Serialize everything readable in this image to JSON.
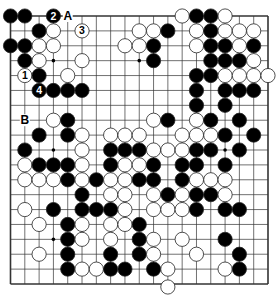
{
  "diagram": {
    "type": "go-board",
    "size": 19,
    "colors": {
      "black": "#000000",
      "white": "#ffffff",
      "line": "#333333"
    },
    "stars": [
      [
        3,
        3
      ],
      [
        3,
        9
      ],
      [
        9,
        3
      ],
      [
        9,
        9
      ],
      [
        9,
        15
      ],
      [
        15,
        3
      ]
    ],
    "stones": [
      {
        "r": 0,
        "c": 0,
        "color": "B"
      },
      {
        "r": 0,
        "c": 1,
        "color": "B"
      },
      {
        "r": 0,
        "c": 3,
        "color": "B",
        "label": "2"
      },
      {
        "r": 0,
        "c": 12,
        "color": "W"
      },
      {
        "r": 0,
        "c": 13,
        "color": "B"
      },
      {
        "r": 0,
        "c": 14,
        "color": "B"
      },
      {
        "r": 0,
        "c": 15,
        "color": "W"
      },
      {
        "r": 1,
        "c": 2,
        "color": "B"
      },
      {
        "r": 1,
        "c": 3,
        "color": "W"
      },
      {
        "r": 1,
        "c": 5,
        "color": "W",
        "label": "3"
      },
      {
        "r": 1,
        "c": 9,
        "color": "W"
      },
      {
        "r": 1,
        "c": 10,
        "color": "W"
      },
      {
        "r": 1,
        "c": 11,
        "color": "B"
      },
      {
        "r": 1,
        "c": 13,
        "color": "W"
      },
      {
        "r": 1,
        "c": 14,
        "color": "B"
      },
      {
        "r": 1,
        "c": 15,
        "color": "W"
      },
      {
        "r": 1,
        "c": 16,
        "color": "W"
      },
      {
        "r": 1,
        "c": 17,
        "color": "W"
      },
      {
        "r": 2,
        "c": 0,
        "color": "B"
      },
      {
        "r": 2,
        "c": 1,
        "color": "B"
      },
      {
        "r": 2,
        "c": 2,
        "color": "W"
      },
      {
        "r": 2,
        "c": 3,
        "color": "W"
      },
      {
        "r": 2,
        "c": 8,
        "color": "W"
      },
      {
        "r": 2,
        "c": 9,
        "color": "W"
      },
      {
        "r": 2,
        "c": 10,
        "color": "B"
      },
      {
        "r": 2,
        "c": 13,
        "color": "W"
      },
      {
        "r": 2,
        "c": 14,
        "color": "B"
      },
      {
        "r": 2,
        "c": 15,
        "color": "B"
      },
      {
        "r": 2,
        "c": 16,
        "color": "W"
      },
      {
        "r": 2,
        "c": 17,
        "color": "B"
      },
      {
        "r": 3,
        "c": 1,
        "color": "B"
      },
      {
        "r": 3,
        "c": 2,
        "color": "W"
      },
      {
        "r": 3,
        "c": 5,
        "color": "W"
      },
      {
        "r": 3,
        "c": 10,
        "color": "B"
      },
      {
        "r": 3,
        "c": 14,
        "color": "B"
      },
      {
        "r": 3,
        "c": 15,
        "color": "B"
      },
      {
        "r": 3,
        "c": 16,
        "color": "B"
      },
      {
        "r": 3,
        "c": 17,
        "color": "W"
      },
      {
        "r": 4,
        "c": 1,
        "color": "W",
        "label": "1"
      },
      {
        "r": 4,
        "c": 2,
        "color": "B"
      },
      {
        "r": 4,
        "c": 4,
        "color": "W"
      },
      {
        "r": 4,
        "c": 13,
        "color": "B"
      },
      {
        "r": 4,
        "c": 14,
        "color": "B"
      },
      {
        "r": 4,
        "c": 15,
        "color": "W"
      },
      {
        "r": 4,
        "c": 16,
        "color": "W"
      },
      {
        "r": 4,
        "c": 17,
        "color": "W"
      },
      {
        "r": 4,
        "c": 18,
        "color": "W"
      },
      {
        "r": 5,
        "c": 2,
        "color": "B",
        "label": "4"
      },
      {
        "r": 5,
        "c": 3,
        "color": "B"
      },
      {
        "r": 5,
        "c": 4,
        "color": "B"
      },
      {
        "r": 5,
        "c": 5,
        "color": "B"
      },
      {
        "r": 5,
        "c": 13,
        "color": "B"
      },
      {
        "r": 5,
        "c": 15,
        "color": "B"
      },
      {
        "r": 5,
        "c": 16,
        "color": "B"
      },
      {
        "r": 5,
        "c": 17,
        "color": "B"
      },
      {
        "r": 6,
        "c": 13,
        "color": "B"
      },
      {
        "r": 6,
        "c": 15,
        "color": "B"
      },
      {
        "r": 7,
        "c": 3,
        "color": "W"
      },
      {
        "r": 7,
        "c": 4,
        "color": "B"
      },
      {
        "r": 7,
        "c": 10,
        "color": "W"
      },
      {
        "r": 7,
        "c": 11,
        "color": "B"
      },
      {
        "r": 7,
        "c": 13,
        "color": "W"
      },
      {
        "r": 7,
        "c": 14,
        "color": "B"
      },
      {
        "r": 7,
        "c": 16,
        "color": "B"
      },
      {
        "r": 8,
        "c": 2,
        "color": "B"
      },
      {
        "r": 8,
        "c": 4,
        "color": "B"
      },
      {
        "r": 8,
        "c": 5,
        "color": "W"
      },
      {
        "r": 8,
        "c": 7,
        "color": "W"
      },
      {
        "r": 8,
        "c": 8,
        "color": "W"
      },
      {
        "r": 8,
        "c": 9,
        "color": "W"
      },
      {
        "r": 8,
        "c": 12,
        "color": "W"
      },
      {
        "r": 8,
        "c": 13,
        "color": "W"
      },
      {
        "r": 8,
        "c": 14,
        "color": "W"
      },
      {
        "r": 8,
        "c": 15,
        "color": "B"
      },
      {
        "r": 8,
        "c": 17,
        "color": "B"
      },
      {
        "r": 9,
        "c": 1,
        "color": "B"
      },
      {
        "r": 9,
        "c": 5,
        "color": "W"
      },
      {
        "r": 9,
        "c": 7,
        "color": "B"
      },
      {
        "r": 9,
        "c": 8,
        "color": "B"
      },
      {
        "r": 9,
        "c": 9,
        "color": "B"
      },
      {
        "r": 9,
        "c": 10,
        "color": "W"
      },
      {
        "r": 9,
        "c": 11,
        "color": "W"
      },
      {
        "r": 9,
        "c": 12,
        "color": "W"
      },
      {
        "r": 9,
        "c": 13,
        "color": "B"
      },
      {
        "r": 9,
        "c": 14,
        "color": "B"
      },
      {
        "r": 9,
        "c": 16,
        "color": "B"
      },
      {
        "r": 10,
        "c": 1,
        "color": "W"
      },
      {
        "r": 10,
        "c": 2,
        "color": "B"
      },
      {
        "r": 10,
        "c": 3,
        "color": "B"
      },
      {
        "r": 10,
        "c": 4,
        "color": "B"
      },
      {
        "r": 10,
        "c": 5,
        "color": "W"
      },
      {
        "r": 10,
        "c": 7,
        "color": "B"
      },
      {
        "r": 10,
        "c": 8,
        "color": "W"
      },
      {
        "r": 10,
        "c": 9,
        "color": "W"
      },
      {
        "r": 10,
        "c": 10,
        "color": "B"
      },
      {
        "r": 10,
        "c": 12,
        "color": "B"
      },
      {
        "r": 10,
        "c": 13,
        "color": "B"
      },
      {
        "r": 10,
        "c": 15,
        "color": "B"
      },
      {
        "r": 11,
        "c": 1,
        "color": "W"
      },
      {
        "r": 11,
        "c": 2,
        "color": "W"
      },
      {
        "r": 11,
        "c": 3,
        "color": "W"
      },
      {
        "r": 11,
        "c": 4,
        "color": "B"
      },
      {
        "r": 11,
        "c": 5,
        "color": "W"
      },
      {
        "r": 11,
        "c": 6,
        "color": "B"
      },
      {
        "r": 11,
        "c": 7,
        "color": "W"
      },
      {
        "r": 11,
        "c": 8,
        "color": "W"
      },
      {
        "r": 11,
        "c": 9,
        "color": "B"
      },
      {
        "r": 11,
        "c": 10,
        "color": "B"
      },
      {
        "r": 11,
        "c": 12,
        "color": "B"
      },
      {
        "r": 11,
        "c": 13,
        "color": "W"
      },
      {
        "r": 11,
        "c": 14,
        "color": "W"
      },
      {
        "r": 11,
        "c": 15,
        "color": "W"
      },
      {
        "r": 12,
        "c": 5,
        "color": "B"
      },
      {
        "r": 12,
        "c": 7,
        "color": "W"
      },
      {
        "r": 12,
        "c": 8,
        "color": "W"
      },
      {
        "r": 12,
        "c": 10,
        "color": "W"
      },
      {
        "r": 12,
        "c": 11,
        "color": "B"
      },
      {
        "r": 12,
        "c": 12,
        "color": "W"
      },
      {
        "r": 12,
        "c": 13,
        "color": "B"
      },
      {
        "r": 12,
        "c": 14,
        "color": "B"
      },
      {
        "r": 12,
        "c": 15,
        "color": "W"
      },
      {
        "r": 13,
        "c": 1,
        "color": "W"
      },
      {
        "r": 13,
        "c": 3,
        "color": "B"
      },
      {
        "r": 13,
        "c": 5,
        "color": "B"
      },
      {
        "r": 13,
        "c": 6,
        "color": "B"
      },
      {
        "r": 13,
        "c": 7,
        "color": "B"
      },
      {
        "r": 13,
        "c": 8,
        "color": "W"
      },
      {
        "r": 13,
        "c": 10,
        "color": "W"
      },
      {
        "r": 13,
        "c": 11,
        "color": "W"
      },
      {
        "r": 13,
        "c": 12,
        "color": "W"
      },
      {
        "r": 13,
        "c": 13,
        "color": "B"
      },
      {
        "r": 13,
        "c": 15,
        "color": "B"
      },
      {
        "r": 13,
        "c": 16,
        "color": "B"
      },
      {
        "r": 14,
        "c": 2,
        "color": "W"
      },
      {
        "r": 14,
        "c": 4,
        "color": "B"
      },
      {
        "r": 14,
        "c": 5,
        "color": "W"
      },
      {
        "r": 14,
        "c": 7,
        "color": "W"
      },
      {
        "r": 14,
        "c": 8,
        "color": "W"
      },
      {
        "r": 14,
        "c": 9,
        "color": "B"
      },
      {
        "r": 15,
        "c": 4,
        "color": "B"
      },
      {
        "r": 15,
        "c": 5,
        "color": "W"
      },
      {
        "r": 15,
        "c": 7,
        "color": "W"
      },
      {
        "r": 15,
        "c": 9,
        "color": "B"
      },
      {
        "r": 15,
        "c": 10,
        "color": "W"
      },
      {
        "r": 15,
        "c": 12,
        "color": "W"
      },
      {
        "r": 15,
        "c": 15,
        "color": "B"
      },
      {
        "r": 16,
        "c": 2,
        "color": "W"
      },
      {
        "r": 16,
        "c": 4,
        "color": "B"
      },
      {
        "r": 16,
        "c": 7,
        "color": "B"
      },
      {
        "r": 16,
        "c": 9,
        "color": "B"
      },
      {
        "r": 16,
        "c": 10,
        "color": "W"
      },
      {
        "r": 16,
        "c": 13,
        "color": "W"
      },
      {
        "r": 16,
        "c": 16,
        "color": "B"
      },
      {
        "r": 17,
        "c": 4,
        "color": "B"
      },
      {
        "r": 17,
        "c": 5,
        "color": "W"
      },
      {
        "r": 17,
        "c": 6,
        "color": "W"
      },
      {
        "r": 17,
        "c": 7,
        "color": "B"
      },
      {
        "r": 17,
        "c": 8,
        "color": "B"
      },
      {
        "r": 17,
        "c": 10,
        "color": "B"
      },
      {
        "r": 17,
        "c": 11,
        "color": "W"
      },
      {
        "r": 17,
        "c": 15,
        "color": "W"
      },
      {
        "r": 17,
        "c": 16,
        "color": "B"
      },
      {
        "r": 18,
        "c": 11,
        "color": "W"
      }
    ],
    "letters": [
      {
        "r": 0,
        "c": 4,
        "text": "A"
      },
      {
        "r": 7,
        "c": 1,
        "text": "B"
      }
    ]
  }
}
